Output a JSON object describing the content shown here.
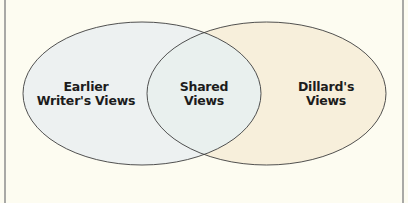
{
  "diagram": {
    "type": "venn",
    "background_color": "#fdfcf1",
    "border_color": "#a9a9a6",
    "sets": [
      {
        "id": "left",
        "label_lines": [
          "Earlier",
          "Writer's Views"
        ],
        "fill": "#eef1ef",
        "stroke": "#3a3a3a"
      },
      {
        "id": "right",
        "label_lines": [
          "Dillard's",
          "Views"
        ],
        "fill": "#f7f0dc",
        "stroke": "#3a3a3a"
      }
    ],
    "intersection": {
      "label_lines": [
        "Shared",
        "Views"
      ],
      "fill": "#eaf0ee"
    }
  }
}
